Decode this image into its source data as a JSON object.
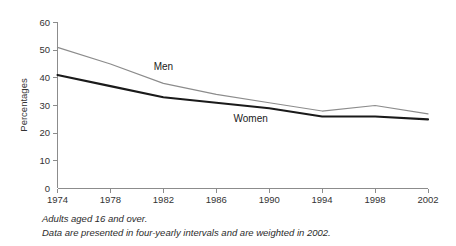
{
  "chart_data": {
    "type": "line",
    "title": "",
    "xlabel": "",
    "ylabel": "Percentages",
    "x": [
      1974,
      1978,
      1982,
      1986,
      1990,
      1994,
      1998,
      2002
    ],
    "xtick_labels": [
      "1974",
      "1978",
      "1982",
      "1986",
      "1990",
      "1994",
      "1998",
      "2002"
    ],
    "xlim": [
      1974,
      2002
    ],
    "ylim": [
      0,
      60
    ],
    "ytick_labels": [
      "0",
      "10",
      "20",
      "30",
      "40",
      "50",
      "60"
    ],
    "ytick_values": [
      0,
      10,
      20,
      30,
      40,
      50,
      60
    ],
    "grid": false,
    "legend_position": "inline-annotations",
    "series": [
      {
        "name": "Men",
        "color": "#8c8c8c",
        "line_width": 1.2,
        "values": [
          51,
          45,
          38,
          34,
          31,
          28,
          30,
          27
        ],
        "label_x": 1982,
        "label_y": 43
      },
      {
        "name": "Women",
        "color": "#1a1a1a",
        "line_width": 2.1,
        "values": [
          41,
          37,
          33,
          31,
          29,
          26,
          26,
          25
        ],
        "label_x": 1988.6,
        "label_y": 24.2
      }
    ],
    "annotations": [
      "Adults aged 16 and over.",
      "Data are presented in four-yearly intervals and are weighted in 2002."
    ]
  },
  "axis": {
    "y_title": "Percentages",
    "y_ticks": [
      "60",
      "50",
      "40",
      "30",
      "20",
      "10",
      "0"
    ],
    "x_ticks": [
      "1974",
      "1978",
      "1982",
      "1986",
      "1990",
      "1994",
      "1998",
      "2002"
    ]
  },
  "series_labels": {
    "men": "Men",
    "women": "Women"
  },
  "footnotes": {
    "line1": "Adults aged 16 and over.",
    "line2": "Data are presented in four-yearly intervals and are weighted in 2002."
  },
  "colors": {
    "men_line": "#8c8c8c",
    "women_line": "#1a1a1a",
    "axis": "#8c8c8c",
    "text": "#333333",
    "background": "#ffffff"
  }
}
